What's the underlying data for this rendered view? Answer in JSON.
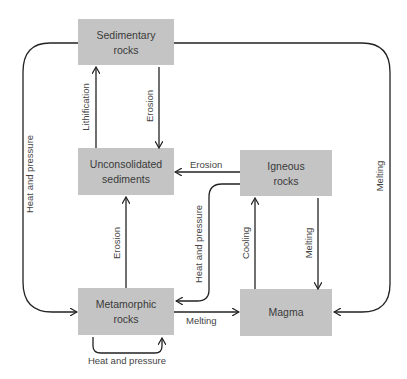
{
  "diagram": {
    "nodes": {
      "sedimentary": {
        "line1": "Sedimentary",
        "line2": "rocks"
      },
      "unconsolidated": {
        "line1": "Unconsolidated",
        "line2": "sediments"
      },
      "igneous": {
        "line1": "Igneous",
        "line2": "rocks"
      },
      "metamorphic": {
        "line1": "Metamorphic",
        "line2": "rocks"
      },
      "magma": {
        "line1": "Magma"
      }
    },
    "edges": {
      "lithification": "Lithification",
      "erosion_sed_to_unc": "Erosion",
      "erosion_ign_to_unc": "Erosion",
      "erosion_meta_to_unc": "Erosion",
      "heat_pressure_sed_to_meta": "Heat and pressure",
      "heat_pressure_ign_to_meta": "Heat and pressure",
      "heat_pressure_meta_self": "Heat and pressure",
      "melting_sed_to_magma": "Melting",
      "melting_meta_to_magma": "Melting",
      "melting_ign_to_magma": "Melting",
      "cooling": "Cooling"
    },
    "colors": {
      "box_fill": "#c4c4c4",
      "line": "#222222",
      "text": "#3a3a3a"
    }
  }
}
